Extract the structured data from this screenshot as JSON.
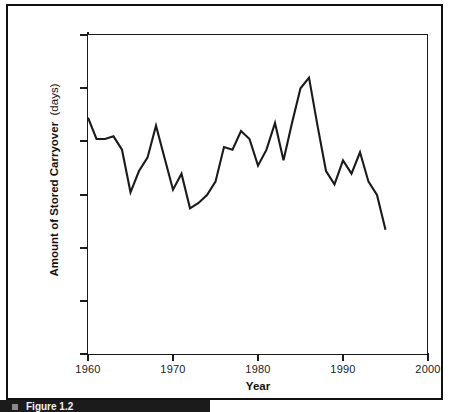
{
  "figure": {
    "caption": "Figure 1.2"
  },
  "chart_data": {
    "type": "line",
    "title": "",
    "xlabel": "Year",
    "ylabel_main": "Amount of Stored Carryover",
    "ylabel_units": "(days)",
    "xlim": [
      1960,
      2000
    ],
    "ylim": [
      0,
      120
    ],
    "grid": false,
    "legend": "none",
    "line_color": "#1a1a1a",
    "x_ticks": [
      1960,
      1970,
      1980,
      1990,
      2000
    ],
    "x_tick_labels": [
      "1960",
      "1970",
      "1980",
      "1990",
      "2000"
    ],
    "y_ticks": [
      0,
      20,
      40,
      60,
      80,
      100,
      120
    ],
    "y_tick_labels": [
      "0",
      "20",
      "40",
      "60",
      "80",
      "100",
      "120"
    ],
    "x": [
      1960,
      1961,
      1962,
      1963,
      1964,
      1965,
      1966,
      1967,
      1968,
      1969,
      1970,
      1971,
      1972,
      1973,
      1974,
      1975,
      1976,
      1977,
      1978,
      1979,
      1980,
      1981,
      1982,
      1983,
      1984,
      1985,
      1986,
      1987,
      1988,
      1989,
      1990,
      1991,
      1992,
      1993,
      1994,
      1995
    ],
    "values": [
      89,
      81,
      81,
      82,
      77,
      61,
      69,
      74,
      86,
      74,
      62,
      68,
      55,
      57,
      60,
      65,
      78,
      77,
      84,
      81,
      71,
      77,
      87,
      73,
      87,
      100,
      104,
      86,
      69,
      64,
      73,
      68,
      76,
      65,
      60,
      47
    ],
    "series_name": "Stored carryover",
    "annotations": []
  }
}
